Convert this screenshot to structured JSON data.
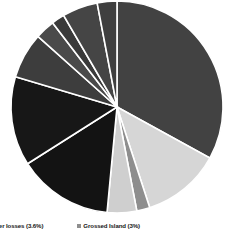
{
  "chart_data": {
    "type": "pie",
    "title": "",
    "subtitle": "",
    "legend_position": "bottom",
    "grid": false,
    "center": {
      "x": 117,
      "y": 107
    },
    "radius": 106,
    "start_angle_deg": -90,
    "direction": "clockwise",
    "divider_color": "#ffffff",
    "background": "#ffffff",
    "categories": [
      "Demand reduction",
      "Grossed Island",
      "Sugar processing",
      "Transmission losses",
      "Distribution losses",
      "Number losses",
      "Industrial supply",
      "Commercial supply",
      "Residential supply",
      "Street lighting",
      "Rural electrification"
    ],
    "values": [
      33.0,
      12.0,
      2.0,
      4.5,
      14.5,
      13.6,
      7.0,
      3.0,
      2.0,
      5.4,
      3.0
    ],
    "colors": [
      "#424242",
      "#d6d6d6",
      "#8e8e8e",
      "#cfcfcf",
      "#131313",
      "#171717",
      "#3d3d3d",
      "#4a4a4a",
      "#3a3a3a",
      "#454545",
      "#3f3f3f"
    ],
    "xlabel": "",
    "ylabel": ""
  },
  "legend": {
    "entries": [
      {
        "label": "Number losses (3.6%)",
        "color": "#171717"
      },
      {
        "label": "Grossed Island (3%)",
        "color": "#8e8e8e"
      }
    ]
  }
}
